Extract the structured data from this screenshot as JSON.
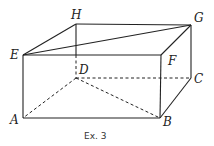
{
  "figure": {
    "caption": "Ex. 3",
    "vertices": {
      "A": {
        "label": "A",
        "x": 23,
        "y": 118
      },
      "B": {
        "label": "B",
        "x": 160,
        "y": 118
      },
      "C": {
        "label": "C",
        "x": 191,
        "y": 78
      },
      "D": {
        "label": "D",
        "x": 76,
        "y": 78
      },
      "E": {
        "label": "E",
        "x": 23,
        "y": 55
      },
      "F": {
        "label": "F",
        "x": 161,
        "y": 55
      },
      "G": {
        "label": "G",
        "x": 191,
        "y": 25
      },
      "H": {
        "label": "H",
        "x": 76,
        "y": 24
      }
    },
    "solid_edges": [
      "EF",
      "FB",
      "BA",
      "AE",
      "EH",
      "HG",
      "GF",
      "GC",
      "CB",
      "EG"
    ],
    "dashed_edges": [
      "HD",
      "DC",
      "DA",
      "DB"
    ],
    "colors": {
      "line": "#222222",
      "background": "#ffffff"
    }
  }
}
